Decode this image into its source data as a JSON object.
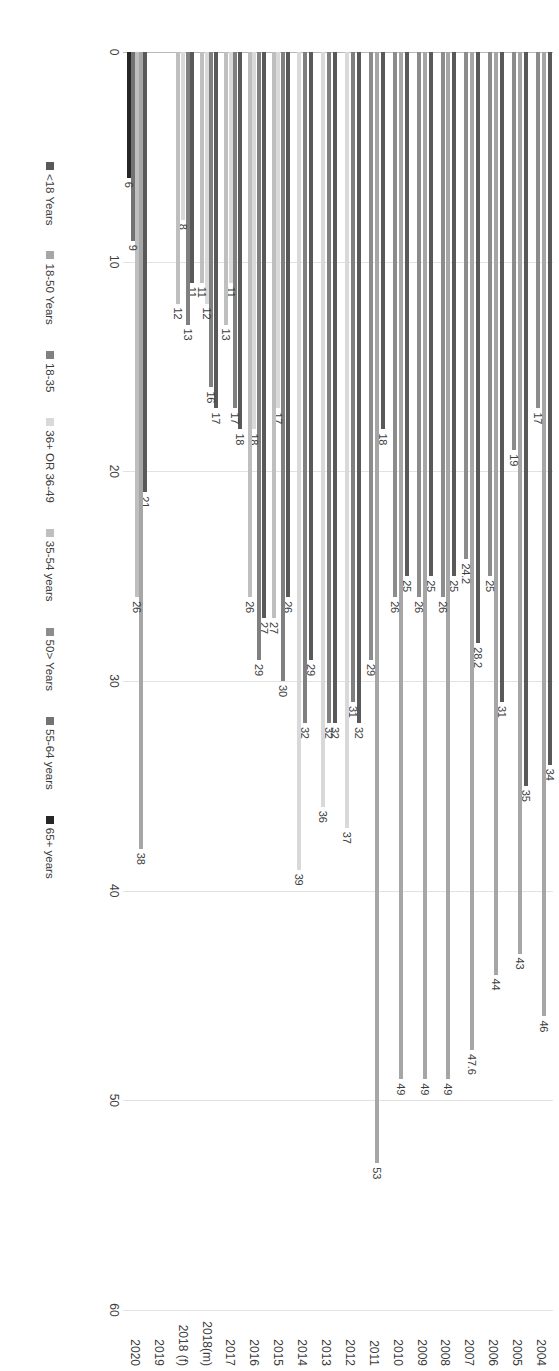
{
  "chart_data": {
    "type": "bar",
    "orientation": "horizontal",
    "title": "",
    "xlabel": "",
    "ylabel": "",
    "xlim": [
      0,
      60
    ],
    "xticks": [
      "0",
      "10",
      "20",
      "30",
      "40",
      "50",
      "60"
    ],
    "grid": true,
    "legend_position": "bottom",
    "categories": [
      "2004",
      "2005",
      "2006",
      "2007",
      "2008",
      "2009",
      "2010",
      "2011",
      "2012",
      "2013",
      "2014",
      "2015",
      "2016",
      "2017",
      "2018(m)",
      "2018 (f)",
      "2019",
      "2020"
    ],
    "series": [
      {
        "name": "<18 Years",
        "color": "#595959"
      },
      {
        "name": "18-50 Years",
        "color": "#a6a6a6"
      },
      {
        "name": "18-35",
        "color": "#808080"
      },
      {
        "name": "36+ OR 36-49",
        "color": "#d9d9d9"
      },
      {
        "name": "35-54 years",
        "color": "#bfbfbf"
      },
      {
        "name": "50> Years",
        "color": "#8c8c8c"
      },
      {
        "name": "55-64 years",
        "color": "#737373"
      },
      {
        "name": "65+ years",
        "color": "#262626"
      }
    ],
    "groups": [
      {
        "category": "2004",
        "bars": [
          {
            "series": "<18 Years",
            "value": 34,
            "label": "34"
          },
          {
            "series": "18-50 Years",
            "value": 46,
            "label": "46"
          },
          {
            "series": "50> Years",
            "value": 17,
            "label": "17"
          }
        ]
      },
      {
        "category": "2005",
        "bars": [
          {
            "series": "<18 Years",
            "value": 35,
            "label": "35"
          },
          {
            "series": "18-50 Years",
            "value": 43,
            "label": "43"
          },
          {
            "series": "50> Years",
            "value": 19,
            "label": "19"
          }
        ]
      },
      {
        "category": "2006",
        "bars": [
          {
            "series": "<18 Years",
            "value": 31,
            "label": "31"
          },
          {
            "series": "18-50 Years",
            "value": 44,
            "label": "44"
          },
          {
            "series": "50> Years",
            "value": 25,
            "label": "25"
          }
        ]
      },
      {
        "category": "2007",
        "bars": [
          {
            "series": "<18 Years",
            "value": 28.2,
            "label": "28.2"
          },
          {
            "series": "18-50 Years",
            "value": 47.6,
            "label": "47.6"
          },
          {
            "series": "50> Years",
            "value": 24.2,
            "label": "24.2"
          }
        ]
      },
      {
        "category": "2008",
        "bars": [
          {
            "series": "<18 Years",
            "value": 25,
            "label": "25"
          },
          {
            "series": "18-50 Years",
            "value": 49,
            "label": "49"
          },
          {
            "series": "50> Years",
            "value": 26,
            "label": "26"
          }
        ]
      },
      {
        "category": "2009",
        "bars": [
          {
            "series": "<18 Years",
            "value": 25,
            "label": "25"
          },
          {
            "series": "18-50 Years",
            "value": 49,
            "label": "49"
          },
          {
            "series": "50> Years",
            "value": 26,
            "label": "26"
          }
        ]
      },
      {
        "category": "2010",
        "bars": [
          {
            "series": "<18 Years",
            "value": 25,
            "label": "25"
          },
          {
            "series": "18-50 Years",
            "value": 49,
            "label": "49"
          },
          {
            "series": "50> Years",
            "value": 26,
            "label": "26"
          }
        ]
      },
      {
        "category": "2011",
        "bars": [
          {
            "series": "<18 Years",
            "value": 18,
            "label": "18"
          },
          {
            "series": "18-50 Years",
            "value": 53,
            "label": "53"
          },
          {
            "series": "50> Years",
            "value": 29,
            "label": "29"
          }
        ]
      },
      {
        "category": "2012",
        "bars": [
          {
            "series": "<18 Years",
            "value": 32,
            "label": "32"
          },
          {
            "series": "18-35",
            "value": 31,
            "label": "31"
          },
          {
            "series": "36+ OR 36-49",
            "value": 37,
            "label": "37"
          }
        ]
      },
      {
        "category": "2013",
        "bars": [
          {
            "series": "<18 Years",
            "value": 32,
            "label": "32"
          },
          {
            "series": "18-35",
            "value": 32,
            "label": "32"
          },
          {
            "series": "36+ OR 36-49",
            "value": 36,
            "label": "36"
          }
        ]
      },
      {
        "category": "2014",
        "bars": [
          {
            "series": "<18 Years",
            "value": 29,
            "label": "29"
          },
          {
            "series": "18-35",
            "value": 32,
            "label": "32"
          },
          {
            "series": "36+ OR 36-49",
            "value": 39,
            "label": "39"
          }
        ]
      },
      {
        "category": "2015",
        "bars": [
          {
            "series": "<18 Years",
            "value": 26,
            "label": "26"
          },
          {
            "series": "18-35",
            "value": 30,
            "label": "30"
          },
          {
            "series": "36+ OR 36-49",
            "value": 17,
            "label": "17"
          },
          {
            "series": "35-54 years",
            "value": 27,
            "label": "27"
          }
        ]
      },
      {
        "category": "2016",
        "bars": [
          {
            "series": "<18 Years",
            "value": 27,
            "label": "27"
          },
          {
            "series": "18-35",
            "value": 29,
            "label": "29"
          },
          {
            "series": "36+ OR 36-49",
            "value": 18,
            "label": "18"
          },
          {
            "series": "35-54 years",
            "value": 26,
            "label": "26"
          }
        ]
      },
      {
        "category": "2017",
        "bars": [
          {
            "series": "<18 Years",
            "value": 18,
            "label": "18"
          },
          {
            "series": "18-35",
            "value": 17,
            "label": "17"
          },
          {
            "series": "36+ OR 36-49",
            "value": 11,
            "label": "11"
          },
          {
            "series": "35-54 years",
            "value": 13,
            "label": "13"
          }
        ]
      },
      {
        "category": "2018(m)",
        "bars": [
          {
            "series": "<18 Years",
            "value": 17,
            "label": "17"
          },
          {
            "series": "18-35",
            "value": 16,
            "label": "16"
          },
          {
            "series": "36+ OR 36-49",
            "value": 12,
            "label": "12"
          },
          {
            "series": "35-54 years",
            "value": 11,
            "label": "11"
          }
        ]
      },
      {
        "category": "2018 (f)",
        "bars": [
          {
            "series": "<18 Years",
            "value": 11,
            "label": "11"
          },
          {
            "series": "18-35",
            "value": 13,
            "label": "13"
          },
          {
            "series": "36+ OR 36-49",
            "value": 8,
            "label": "8"
          },
          {
            "series": "35-54 years",
            "value": 12,
            "label": "12"
          }
        ]
      },
      {
        "category": "2019",
        "bars": []
      },
      {
        "category": "2020",
        "bars": [
          {
            "series": "<18 Years",
            "value": 21,
            "label": "21"
          },
          {
            "series": "18-50 Years",
            "value": 38,
            "label": "38"
          },
          {
            "series": "35-54 years",
            "value": 26,
            "label": "26"
          },
          {
            "series": "55-64 years",
            "value": 9,
            "label": "9"
          },
          {
            "series": "65+ years",
            "value": 6,
            "label": "6"
          }
        ]
      }
    ]
  }
}
